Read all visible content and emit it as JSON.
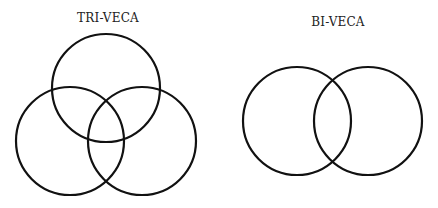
{
  "diagrams": [
    {
      "title": "TRI-VECA",
      "title_pos": {
        "x": 108,
        "y": 11
      },
      "circles": [
        {
          "cx": 106,
          "cy": 88,
          "r": 54
        },
        {
          "cx": 70,
          "cy": 141,
          "r": 54
        },
        {
          "cx": 142,
          "cy": 141,
          "r": 54
        }
      ]
    },
    {
      "title": "BI-VECA",
      "title_pos": {
        "x": 338,
        "y": 15
      },
      "circles": [
        {
          "cx": 297,
          "cy": 121,
          "r": 54
        },
        {
          "cx": 368,
          "cy": 121,
          "r": 54
        }
      ]
    }
  ],
  "colors": {
    "stroke": "#111111",
    "text": "#222222",
    "background": "#ffffff"
  }
}
